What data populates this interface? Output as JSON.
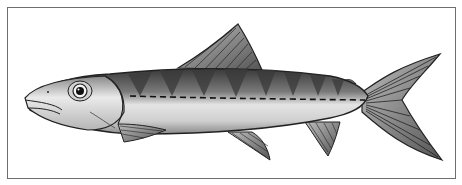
{
  "image": {
    "subject": "fish-illustration",
    "caption": "",
    "colors": {
      "frame": "#6e6e6e",
      "dark": "#2a2a2a",
      "body_light": "#d8d8d8",
      "body_mid": "#9a9a9a",
      "background": "#ffffff"
    }
  }
}
